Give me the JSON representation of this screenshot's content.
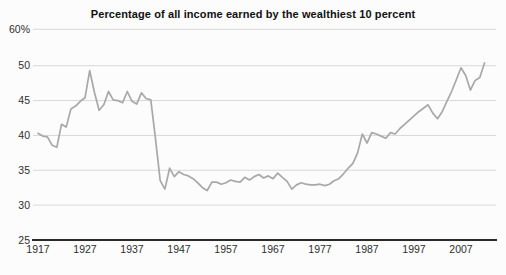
{
  "title": "Percentage of all income earned by the wealthiest 10 percent",
  "colors": {
    "line": "#a8a8a8",
    "grid": "#d8d8d8",
    "axis": "#2a2a2a",
    "label": "#2e2e2e",
    "background": "#fcfcfc"
  },
  "chart_data": {
    "type": "line",
    "title": "Percentage of all income earned by the wealthiest 10 percent",
    "xlabel": "",
    "ylabel": "Percent of all income",
    "x_range": [
      1917,
      2012
    ],
    "ylim": [
      25,
      60
    ],
    "grid": "horizontal",
    "legend": "none",
    "y_ticks": [
      {
        "label": "60%",
        "value": 60
      },
      {
        "label": "50",
        "value": 50
      },
      {
        "label": "45",
        "value": 45
      },
      {
        "label": "40",
        "value": 40
      },
      {
        "label": "35",
        "value": 35
      },
      {
        "label": "30",
        "value": 30
      },
      {
        "label": "25",
        "value": 25
      }
    ],
    "x_ticks": [
      "1917",
      "1927",
      "1937",
      "1947",
      "1957",
      "1967",
      "1977",
      "1987",
      "1997",
      "2007"
    ],
    "series": [
      {
        "name": "Share of all income earned by wealthiest 10 percent",
        "start_year": 1917,
        "end_year": 2012,
        "values": [
          40.3,
          39.9,
          39.8,
          38.6,
          38.3,
          41.6,
          41.2,
          43.8,
          44.2,
          44.9,
          45.4,
          49.3,
          46.2,
          43.6,
          44.4,
          46.3,
          45.1,
          45.0,
          44.7,
          46.3,
          44.9,
          44.5,
          46.1,
          45.3,
          45.1,
          39.5,
          33.5,
          32.3,
          35.3,
          34.1,
          34.8,
          34.4,
          34.2,
          33.8,
          33.2,
          32.5,
          32.1,
          33.3,
          33.3,
          33.0,
          33.2,
          33.6,
          33.4,
          33.3,
          34.0,
          33.6,
          34.1,
          34.4,
          33.9,
          34.2,
          33.8,
          34.6,
          34.0,
          33.4,
          32.3,
          32.9,
          33.2,
          33.0,
          32.9,
          32.9,
          33.0,
          32.8,
          33.0,
          33.5,
          33.8,
          34.5,
          35.3,
          36.0,
          37.5,
          40.2,
          38.9,
          40.4,
          40.2,
          39.9,
          39.6,
          40.4,
          40.2,
          41.0,
          41.6,
          42.2,
          42.8,
          43.4,
          43.9,
          44.4,
          43.2,
          42.4,
          43.4,
          44.9,
          46.3,
          48.0,
          49.7,
          48.6,
          46.5,
          47.9,
          48.3,
          50.4
        ]
      }
    ]
  }
}
